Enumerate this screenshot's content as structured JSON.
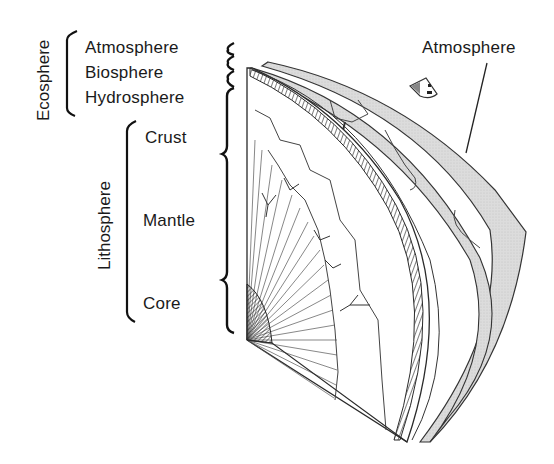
{
  "diagram": {
    "type": "labeled cutaway illustration of Earth layers",
    "groups": [
      {
        "label": "Ecosphere",
        "members": [
          "Atmosphere",
          "Biosphere",
          "Hydrosphere"
        ]
      },
      {
        "label": "Lithosphere",
        "members": [
          "Crust",
          "Mantle",
          "Core"
        ]
      }
    ],
    "layer_labels": [
      "Atmosphere",
      "Biosphere",
      "Hydrosphere",
      "Crust",
      "Mantle",
      "Core"
    ],
    "callout": {
      "label": "Atmosphere",
      "points_to": "outer shaded shell"
    },
    "colors": {
      "line": "#2a2a2a",
      "shell_fill": "#d9d9d9",
      "background": "#ffffff"
    }
  }
}
